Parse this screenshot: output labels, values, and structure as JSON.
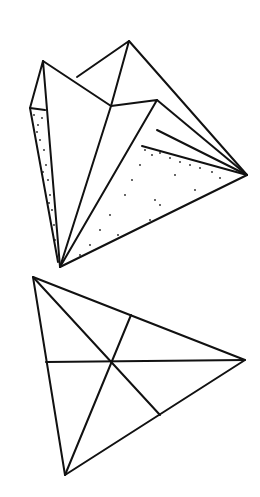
{
  "figures": [
    {
      "id": "folded-paper",
      "description": "Folded paper triangle with shaded flaps"
    },
    {
      "id": "triangle-medians",
      "description": "Triangle with three medians meeting at centroid"
    }
  ],
  "colors": {
    "line": "#111111",
    "background": "#ffffff"
  }
}
